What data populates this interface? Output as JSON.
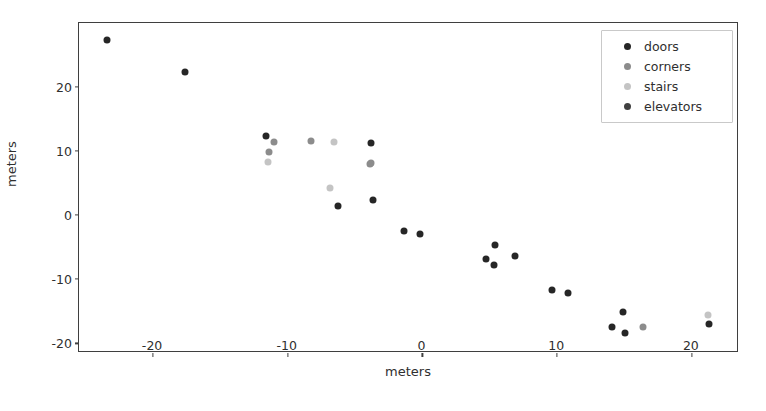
{
  "figure": {
    "background_color": "#ffffff",
    "axes_edge_color": "#3f3f3f"
  },
  "chart_data": {
    "type": "scatter",
    "title": "",
    "xlabel": "meters",
    "ylabel": "meters",
    "xlim": [
      -25.5,
      23.5
    ],
    "ylim": [
      -21.5,
      30.0
    ],
    "xticks": [
      -20,
      -10,
      0,
      10,
      20
    ],
    "xticklabels": [
      "-20",
      "-10",
      "0",
      "10",
      "20"
    ],
    "yticks": [
      20,
      10,
      0,
      -10,
      -20
    ],
    "yticklabels": [
      "20",
      "10",
      "0",
      "-10",
      "-20"
    ],
    "grid": false,
    "legend_position": "upper right",
    "series": [
      {
        "name": "doors",
        "color": "#262626",
        "points": [
          [
            -23.4,
            27.4
          ],
          [
            -17.6,
            22.4
          ],
          [
            -11.6,
            12.4
          ],
          [
            -6.3,
            1.5
          ],
          [
            -3.8,
            11.3
          ],
          [
            -3.7,
            2.4
          ],
          [
            -1.4,
            -2.4
          ],
          [
            -0.2,
            -2.9
          ],
          [
            4.7,
            -6.8
          ],
          [
            5.3,
            -7.7
          ],
          [
            5.4,
            -4.7
          ],
          [
            6.9,
            -6.3
          ],
          [
            9.6,
            -11.7
          ],
          [
            10.8,
            -12.2
          ],
          [
            14.1,
            -17.4
          ],
          [
            14.9,
            -15.1
          ],
          [
            15.0,
            -18.4
          ],
          [
            21.3,
            -16.9
          ]
        ]
      },
      {
        "name": "corners",
        "color": "#8c8c8c",
        "points": [
          [
            -11.0,
            11.4
          ],
          [
            -11.4,
            9.9
          ],
          [
            -8.3,
            11.6
          ],
          [
            -3.9,
            8.0
          ],
          [
            -3.8,
            8.1
          ],
          [
            16.4,
            -17.4
          ]
        ]
      },
      {
        "name": "stairs",
        "color": "#c4c4c4",
        "points": [
          [
            -11.5,
            8.3
          ],
          [
            -6.6,
            11.5
          ],
          [
            -6.9,
            4.2
          ],
          [
            21.2,
            -15.5
          ]
        ]
      },
      {
        "name": "elevators",
        "color": "#404040",
        "points": []
      }
    ]
  },
  "legend": {
    "entries": [
      {
        "label": "doors",
        "color": "#262626"
      },
      {
        "label": "corners",
        "color": "#8c8c8c"
      },
      {
        "label": "stairs",
        "color": "#c4c4c4"
      },
      {
        "label": "elevators",
        "color": "#404040"
      }
    ]
  }
}
